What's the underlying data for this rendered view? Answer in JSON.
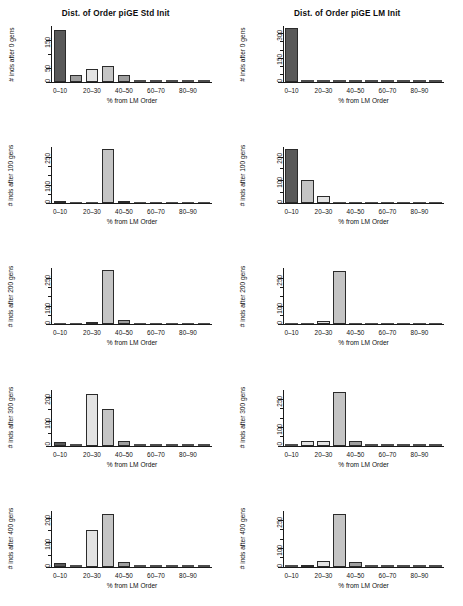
{
  "figure": {
    "width": 463,
    "height": 606,
    "background": "#ffffff",
    "columns": 2,
    "rows": 5
  },
  "axis_labels": {
    "xlabel": "% from LM Order",
    "xticks": [
      "0–10",
      "20–30",
      "40–50",
      "60–70",
      "80–90"
    ],
    "xbins": [
      "0–10",
      "10–20",
      "20–30",
      "30–40",
      "40–50",
      "50–60",
      "60–70",
      "70–80",
      "80–90",
      "90–100"
    ]
  },
  "palette": {
    "bar_dark": "#595959",
    "bar_medium": "#9e9e9e",
    "bar_light": "#e3e3e3",
    "bar_midlight": "#c4c4c4",
    "axis": "#1a1a1a",
    "text": "#111111"
  },
  "chart_data": [
    {
      "id": "std-init-gen-0",
      "type": "bar",
      "title": "Dist. of Order piGE Std Init",
      "title_visible": true,
      "column": "left",
      "row": 1,
      "xlabel": "% from LM Order",
      "ylabel": "# inds after 0 gens",
      "categories": [
        "0–10",
        "10–20",
        "20–30",
        "30–40",
        "40–50",
        "50–60",
        "60–70",
        "70–80",
        "80–90",
        "90–100"
      ],
      "values": [
        185,
        24,
        45,
        58,
        26,
        1,
        1,
        1,
        1,
        1
      ],
      "shades": [
        "dark",
        "medium",
        "light",
        "midlight",
        "medium",
        "medium",
        "medium",
        "medium",
        "medium",
        "medium"
      ],
      "ylim": [
        0,
        200
      ],
      "yticks": [
        0,
        50,
        100,
        150
      ],
      "ytick_labels": [
        "0",
        "50",
        "",
        "150"
      ],
      "grid": false
    },
    {
      "id": "lm-init-gen-0",
      "type": "bar",
      "title": "Dist. of Order piGE LM Init",
      "title_visible": true,
      "column": "right",
      "row": 1,
      "xlabel": "% from LM Order",
      "ylabel": "# inds after 0 gens",
      "categories": [
        "0–10",
        "10–20",
        "20–30",
        "30–40",
        "40–50",
        "50–60",
        "60–70",
        "70–80",
        "80–90",
        "90–100"
      ],
      "values": [
        330,
        2,
        2,
        2,
        2,
        2,
        2,
        2,
        2,
        2
      ],
      "shades": [
        "dark",
        "medium",
        "medium",
        "medium",
        "medium",
        "medium",
        "medium",
        "medium",
        "medium",
        "medium"
      ],
      "ylim": [
        0,
        345
      ],
      "yticks": [
        0,
        50,
        100,
        150,
        200,
        250,
        300
      ],
      "ytick_labels": [
        "0",
        "",
        "",
        "150",
        "",
        "",
        "300"
      ],
      "grid": false
    },
    {
      "id": "std-init-gen-100",
      "type": "bar",
      "title": "Dist. of Order piGE Std Init",
      "title_visible": false,
      "column": "left",
      "row": 2,
      "xlabel": "% from LM Order",
      "ylabel": "# inds after 100 gens",
      "categories": [
        "0–10",
        "10–20",
        "20–30",
        "30–40",
        "40–50",
        "50–60",
        "60–70",
        "70–80",
        "80–90",
        "90–100"
      ],
      "values": [
        12,
        8,
        11,
        290,
        14,
        2,
        2,
        2,
        2,
        2
      ],
      "shades": [
        "dark",
        "dark",
        "light",
        "midlight",
        "medium",
        "medium",
        "medium",
        "medium",
        "medium",
        "medium"
      ],
      "ylim": [
        0,
        300
      ],
      "yticks": [
        0,
        50,
        100,
        150,
        200,
        250
      ],
      "ytick_labels": [
        "0",
        "",
        "100",
        "",
        "",
        "250"
      ],
      "grid": false
    },
    {
      "id": "lm-init-gen-100",
      "type": "bar",
      "title": "Dist. of Order piGE LM Init",
      "title_visible": false,
      "column": "right",
      "row": 2,
      "xlabel": "% from LM Order",
      "ylabel": "# inds after 100 gens",
      "categories": [
        "0–10",
        "10–20",
        "20–30",
        "30–40",
        "40–50",
        "50–60",
        "60–70",
        "70–80",
        "80–90",
        "90–100"
      ],
      "values": [
        232,
        100,
        30,
        4,
        2,
        2,
        2,
        2,
        2,
        2
      ],
      "shades": [
        "dark",
        "midlight",
        "light",
        "medium",
        "medium",
        "medium",
        "medium",
        "medium",
        "medium",
        "medium"
      ],
      "ylim": [
        0,
        240
      ],
      "yticks": [
        0,
        50,
        100,
        150,
        200
      ],
      "ytick_labels": [
        "0",
        "",
        "100",
        "",
        "200"
      ],
      "grid": false
    },
    {
      "id": "std-init-gen-200",
      "type": "bar",
      "title": "Dist. of Order piGE Std Init",
      "title_visible": false,
      "column": "left",
      "row": 3,
      "xlabel": "% from LM Order",
      "ylabel": "# inds after 200 gens",
      "categories": [
        "0–10",
        "10–20",
        "20–30",
        "30–40",
        "40–50",
        "50–60",
        "60–70",
        "70–80",
        "80–90",
        "90–100"
      ],
      "values": [
        10,
        10,
        14,
        292,
        22,
        2,
        2,
        2,
        2,
        2
      ],
      "shades": [
        "dark",
        "dark",
        "light",
        "midlight",
        "medium",
        "medium",
        "medium",
        "medium",
        "medium",
        "medium"
      ],
      "ylim": [
        0,
        300
      ],
      "yticks": [
        0,
        50,
        100,
        150,
        200,
        250
      ],
      "ytick_labels": [
        "0",
        "",
        "100",
        "",
        "",
        "250"
      ],
      "grid": false
    },
    {
      "id": "lm-init-gen-200",
      "type": "bar",
      "title": "Dist. of Order piGE LM Init",
      "title_visible": false,
      "column": "right",
      "row": 3,
      "xlabel": "% from LM Order",
      "ylabel": "# inds after 200 gens",
      "categories": [
        "0–10",
        "10–20",
        "20–30",
        "30–40",
        "40–50",
        "50–60",
        "60–70",
        "70–80",
        "80–90",
        "90–100"
      ],
      "values": [
        6,
        10,
        16,
        288,
        6,
        2,
        2,
        2,
        2,
        2
      ],
      "shades": [
        "dark",
        "dark",
        "light",
        "midlight",
        "medium",
        "medium",
        "medium",
        "medium",
        "medium",
        "medium"
      ],
      "ylim": [
        0,
        300
      ],
      "yticks": [
        0,
        50,
        100,
        150,
        200,
        250
      ],
      "ytick_labels": [
        "0",
        "",
        "100",
        "",
        "",
        "250"
      ],
      "grid": false
    },
    {
      "id": "std-init-gen-300",
      "type": "bar",
      "title": "Dist. of Order piGE Std Init",
      "title_visible": false,
      "column": "left",
      "row": 4,
      "xlabel": "% from LM Order",
      "ylabel": "# inds after 300 gens",
      "categories": [
        "0–10",
        "10–20",
        "20–30",
        "30–40",
        "40–50",
        "50–60",
        "60–70",
        "70–80",
        "80–90",
        "90–100"
      ],
      "values": [
        14,
        4,
        212,
        150,
        18,
        2,
        2,
        2,
        2,
        2
      ],
      "shades": [
        "dark",
        "medium",
        "light",
        "midlight",
        "medium",
        "medium",
        "medium",
        "medium",
        "medium",
        "medium"
      ],
      "ylim": [
        0,
        230
      ],
      "yticks": [
        0,
        50,
        100,
        150,
        200
      ],
      "ytick_labels": [
        "0",
        "",
        "100",
        "",
        "200"
      ],
      "grid": false
    },
    {
      "id": "lm-init-gen-300",
      "type": "bar",
      "title": "Dist. of Order piGE LM Init",
      "title_visible": false,
      "column": "right",
      "row": 4,
      "xlabel": "% from LM Order",
      "ylabel": "# inds after 300 gens",
      "categories": [
        "0–10",
        "10–20",
        "20–30",
        "30–40",
        "40–50",
        "50–60",
        "60–70",
        "70–80",
        "80–90",
        "90–100"
      ],
      "values": [
        6,
        24,
        26,
        286,
        24,
        2,
        2,
        2,
        2,
        2
      ],
      "shades": [
        "dark",
        "light",
        "light",
        "midlight",
        "medium",
        "medium",
        "medium",
        "medium",
        "medium",
        "medium"
      ],
      "ylim": [
        0,
        300
      ],
      "yticks": [
        0,
        50,
        100,
        150,
        200,
        250
      ],
      "ytick_labels": [
        "0",
        "",
        "100",
        "",
        "",
        "250"
      ],
      "grid": false
    },
    {
      "id": "std-init-gen-400",
      "type": "bar",
      "title": "Dist. of Order piGE Std Init",
      "title_visible": false,
      "column": "left",
      "row": 5,
      "xlabel": "% from LM Order",
      "ylabel": "# inds after 400 gens",
      "categories": [
        "0–10",
        "10–20",
        "20–30",
        "30–40",
        "40–50",
        "50–60",
        "60–70",
        "70–80",
        "80–90",
        "90–100"
      ],
      "values": [
        14,
        4,
        150,
        216,
        20,
        2,
        2,
        2,
        2,
        2
      ],
      "shades": [
        "dark",
        "medium",
        "light",
        "midlight",
        "medium",
        "medium",
        "medium",
        "medium",
        "medium",
        "medium"
      ],
      "ylim": [
        0,
        230
      ],
      "yticks": [
        0,
        50,
        100,
        150,
        200
      ],
      "ytick_labels": [
        "0",
        "",
        "100",
        "",
        "200"
      ],
      "grid": false
    },
    {
      "id": "lm-init-gen-400",
      "type": "bar",
      "title": "Dist. of Order piGE LM Init",
      "title_visible": false,
      "column": "right",
      "row": 5,
      "xlabel": "% from LM Order",
      "ylabel": "# inds after 400 gens",
      "categories": [
        "0–10",
        "10–20",
        "20–30",
        "30–40",
        "40–50",
        "50–60",
        "60–70",
        "70–80",
        "80–90",
        "90–100"
      ],
      "values": [
        10,
        12,
        32,
        280,
        26,
        2,
        2,
        2,
        2,
        2
      ],
      "shades": [
        "dark",
        "dark",
        "light",
        "midlight",
        "medium",
        "medium",
        "medium",
        "medium",
        "medium",
        "medium"
      ],
      "ylim": [
        0,
        300
      ],
      "yticks": [
        0,
        50,
        100,
        150,
        200,
        250
      ],
      "ytick_labels": [
        "0",
        "",
        "100",
        "",
        "",
        "250"
      ],
      "grid": false
    }
  ]
}
